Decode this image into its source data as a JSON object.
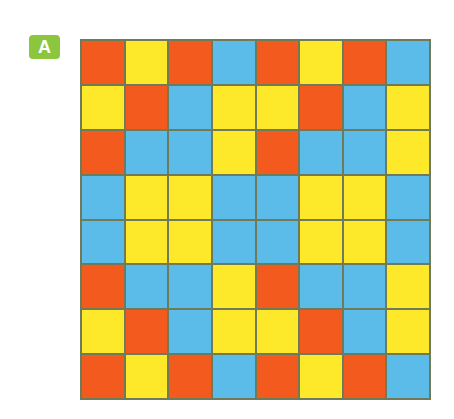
{
  "label": "A",
  "colors": {
    "R": "#f25a1e",
    "Y": "#fde82a",
    "B": "#5bbcea",
    "badge": "#8cc63f"
  },
  "grid": [
    [
      "R",
      "Y",
      "R",
      "B",
      "R",
      "Y",
      "R",
      "B"
    ],
    [
      "Y",
      "R",
      "B",
      "Y",
      "Y",
      "R",
      "B",
      "Y"
    ],
    [
      "R",
      "B",
      "B",
      "Y",
      "R",
      "B",
      "B",
      "Y"
    ],
    [
      "B",
      "Y",
      "Y",
      "B",
      "B",
      "Y",
      "Y",
      "B"
    ],
    [
      "B",
      "Y",
      "Y",
      "B",
      "B",
      "Y",
      "Y",
      "B"
    ],
    [
      "R",
      "B",
      "B",
      "Y",
      "R",
      "B",
      "B",
      "Y"
    ],
    [
      "Y",
      "R",
      "B",
      "Y",
      "Y",
      "R",
      "B",
      "Y"
    ],
    [
      "R",
      "Y",
      "R",
      "B",
      "R",
      "Y",
      "R",
      "B"
    ]
  ]
}
